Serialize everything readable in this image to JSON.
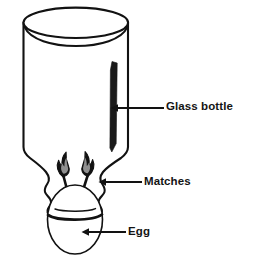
{
  "figure": {
    "background_color": "#ffffff",
    "line_color": "#121212",
    "highlight_color": "#1a1a1a",
    "flame_inner_color": "#8c8c8c",
    "label_color": "#141414"
  },
  "labels": [
    {
      "id": "glass-bottle",
      "text": "Glass bottle",
      "leader": {
        "from_x": 164,
        "from_y": 108,
        "to_x": 112,
        "to_y": 108,
        "arrow": "left"
      }
    },
    {
      "id": "matches",
      "text": "Matches",
      "leader": {
        "from_x": 142,
        "from_y": 182,
        "to_x": 99,
        "to_y": 182,
        "arrow": "left"
      }
    },
    {
      "id": "egg",
      "text": "Egg",
      "leader": {
        "from_x": 126,
        "from_y": 232,
        "to_x": 82,
        "to_y": 232,
        "arrow": "left"
      }
    }
  ],
  "parts": [
    {
      "id": "bottle-rim",
      "name": "Bottle rim (opening, pointing up)"
    },
    {
      "id": "bottle-body",
      "name": "Bottle body"
    },
    {
      "id": "bottle-shoulder",
      "name": "Bottle shoulder tapering down to neck"
    },
    {
      "id": "bottle-neck",
      "name": "Wavy bottle neck / mouth"
    },
    {
      "id": "glass-highlight",
      "name": "Dark specular highlight stripe on glass"
    },
    {
      "id": "match-left",
      "name": "Left burning match"
    },
    {
      "id": "match-right",
      "name": "Right burning match"
    },
    {
      "id": "egg",
      "name": "Egg seated in the bottle mouth"
    }
  ]
}
